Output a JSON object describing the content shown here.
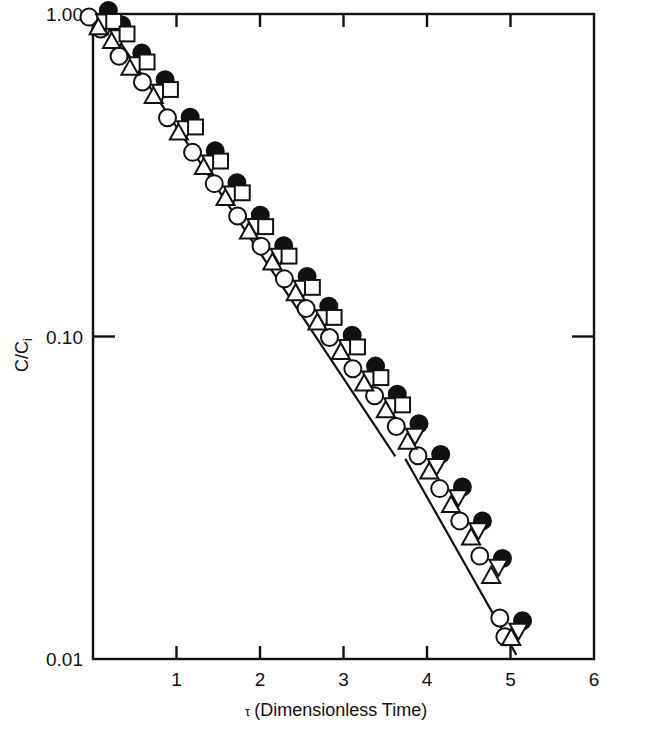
{
  "chart_data": {
    "type": "scatter",
    "title": "",
    "xlabel": "τ (Dimensionless Time)",
    "ylabel": "C/C",
    "ylabel_sub": "i",
    "xlim": [
      0,
      6
    ],
    "ylim": [
      0.01,
      1.0
    ],
    "yscale": "log",
    "grid": false,
    "legend": "none",
    "xticks": [
      "1",
      "2",
      "3",
      "4",
      "5",
      "6"
    ],
    "xtick_values": [
      1,
      2,
      3,
      4,
      5,
      6
    ],
    "yticks": [
      "1.00",
      "0.10",
      "0.01"
    ],
    "ytick_values": [
      1.0,
      0.1,
      0.01
    ],
    "frame": "box",
    "series": [
      {
        "name": "open-circle",
        "marker": "circle-open",
        "points": [
          [
            0.06,
            0.985
          ],
          [
            0.2,
            0.905
          ],
          [
            0.42,
            0.745
          ],
          [
            0.7,
            0.62
          ],
          [
            1.0,
            0.48
          ],
          [
            1.3,
            0.375
          ],
          [
            1.56,
            0.3
          ],
          [
            1.84,
            0.238
          ],
          [
            2.12,
            0.192
          ],
          [
            2.4,
            0.152
          ],
          [
            2.66,
            0.123
          ],
          [
            2.94,
            0.1
          ],
          [
            3.22,
            0.08
          ],
          [
            3.48,
            0.066
          ],
          [
            3.74,
            0.053
          ],
          [
            4.0,
            0.043
          ],
          [
            4.26,
            0.034
          ],
          [
            4.5,
            0.027
          ],
          [
            4.74,
            0.021
          ],
          [
            4.98,
            0.0135
          ],
          [
            5.04,
            0.0118
          ]
        ]
      },
      {
        "name": "filled-circle",
        "marker": "circle-filled",
        "points": [
          [
            0.1,
            0.975
          ],
          [
            0.26,
            0.88
          ],
          [
            0.5,
            0.72
          ],
          [
            0.78,
            0.595
          ],
          [
            1.08,
            0.455
          ],
          [
            1.38,
            0.358
          ],
          [
            1.64,
            0.285
          ],
          [
            1.92,
            0.226
          ],
          [
            2.2,
            0.182
          ],
          [
            2.48,
            0.146
          ],
          [
            2.74,
            0.118
          ],
          [
            3.02,
            0.096
          ],
          [
            3.3,
            0.077
          ],
          [
            3.56,
            0.063
          ],
          [
            3.82,
            0.051
          ],
          [
            4.08,
            0.041
          ],
          [
            4.34,
            0.0325
          ],
          [
            4.58,
            0.0255
          ],
          [
            4.82,
            0.0195
          ],
          [
            5.06,
            0.0125
          ]
        ]
      },
      {
        "name": "up-triangle",
        "marker": "triangle-up",
        "points": [
          [
            0.08,
            0.955
          ],
          [
            0.24,
            0.865
          ],
          [
            0.46,
            0.715
          ],
          [
            0.74,
            0.585
          ],
          [
            1.04,
            0.45
          ],
          [
            1.34,
            0.352
          ],
          [
            1.6,
            0.282
          ],
          [
            1.88,
            0.222
          ],
          [
            2.16,
            0.178
          ],
          [
            2.44,
            0.143
          ],
          [
            2.7,
            0.116
          ],
          [
            2.98,
            0.094
          ],
          [
            3.26,
            0.075
          ],
          [
            3.52,
            0.062
          ],
          [
            3.78,
            0.0495
          ],
          [
            4.04,
            0.04
          ],
          [
            4.3,
            0.0315
          ],
          [
            4.54,
            0.025
          ],
          [
            4.78,
            0.019
          ],
          [
            5.02,
            0.0122
          ]
        ]
      },
      {
        "name": "down-triangle",
        "marker": "triangle-down",
        "points": [
          [
            0.05,
            0.99
          ],
          [
            0.22,
            0.885
          ],
          [
            0.44,
            0.73
          ],
          [
            0.72,
            0.6
          ],
          [
            1.02,
            0.462
          ],
          [
            1.32,
            0.362
          ],
          [
            1.58,
            0.29
          ],
          [
            1.86,
            0.23
          ],
          [
            2.14,
            0.186
          ],
          [
            2.42,
            0.148
          ],
          [
            2.68,
            0.12
          ],
          [
            2.96,
            0.097
          ],
          [
            3.24,
            0.0775
          ],
          [
            3.5,
            0.064
          ],
          [
            3.76,
            0.0515
          ],
          [
            4.02,
            0.0415
          ],
          [
            4.28,
            0.0332
          ],
          [
            4.52,
            0.0262
          ],
          [
            4.76,
            0.0202
          ],
          [
            5.0,
            0.0128
          ]
        ]
      },
      {
        "name": "open-square",
        "marker": "square-open",
        "points": [
          [
            0.14,
            0.935
          ],
          [
            0.3,
            0.855
          ],
          [
            0.54,
            0.7
          ],
          [
            0.82,
            0.575
          ],
          [
            1.12,
            0.44
          ],
          [
            1.42,
            0.345
          ],
          [
            1.68,
            0.275
          ],
          [
            1.96,
            0.216
          ],
          [
            2.24,
            0.175
          ],
          [
            2.52,
            0.14
          ],
          [
            2.78,
            0.113
          ],
          [
            3.06,
            0.0915
          ],
          [
            3.34,
            0.0735
          ],
          [
            3.6,
            0.0605
          ]
        ]
      }
    ],
    "fit_lines": [
      {
        "name": "upper-fit-line",
        "x_start": 0.2,
        "y_start": 0.915,
        "x_end": 3.62,
        "y_end": 0.0425
      },
      {
        "name": "lower-fit-line",
        "x_start": 3.74,
        "y_start": 0.0418,
        "x_end": 5.07,
        "y_end": 0.0103
      }
    ]
  }
}
